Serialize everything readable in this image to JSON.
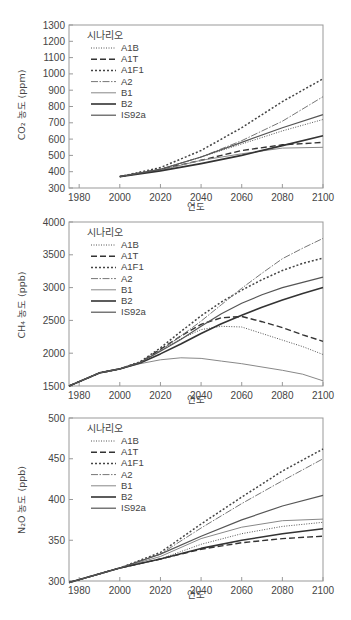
{
  "legend": {
    "title": "시나리오",
    "entries": [
      {
        "name": "A1B",
        "style": "dotted-fine",
        "color": "#555555"
      },
      {
        "name": "A1T",
        "style": "dashed",
        "color": "#333333"
      },
      {
        "name": "A1F1",
        "style": "dotted-coarse",
        "color": "#444444"
      },
      {
        "name": "A2",
        "style": "dash-dot",
        "color": "#777777"
      },
      {
        "name": "B1",
        "style": "solid-light",
        "color": "#888888"
      },
      {
        "name": "B2",
        "style": "solid-thick",
        "color": "#333333"
      },
      {
        "name": "IS92a",
        "style": "solid",
        "color": "#555555"
      }
    ]
  },
  "chart_data": [
    {
      "type": "line",
      "title": "",
      "xlabel": "연도",
      "ylabel": "CO₂ 농도 (ppm)",
      "xlim": [
        1975,
        2100
      ],
      "ylim": [
        300,
        1300
      ],
      "xticks": [
        1980,
        2000,
        2020,
        2040,
        2060,
        2080,
        2100
      ],
      "yticks": [
        300,
        400,
        500,
        600,
        700,
        800,
        900,
        1000,
        1100,
        1200,
        1300
      ],
      "x": [
        2000,
        2020,
        2040,
        2060,
        2080,
        2100
      ],
      "series": [
        {
          "name": "A1B",
          "values": [
            370,
            415,
            490,
            570,
            650,
            720
          ]
        },
        {
          "name": "A1T",
          "values": [
            370,
            415,
            470,
            530,
            565,
            580
          ]
        },
        {
          "name": "A1F1",
          "values": [
            370,
            425,
            530,
            670,
            830,
            970
          ]
        },
        {
          "name": "A2",
          "values": [
            370,
            415,
            490,
            590,
            710,
            860
          ]
        },
        {
          "name": "B1",
          "values": [
            370,
            410,
            470,
            510,
            545,
            550
          ]
        },
        {
          "name": "B2",
          "values": [
            370,
            405,
            450,
            500,
            560,
            620
          ]
        },
        {
          "name": "IS92a",
          "values": [
            370,
            415,
            490,
            580,
            670,
            750
          ]
        }
      ]
    },
    {
      "type": "line",
      "title": "",
      "xlabel": "연도",
      "ylabel": "CH₄ 농도 (ppb)",
      "xlim": [
        1975,
        2100
      ],
      "ylim": [
        1500,
        4000
      ],
      "xticks": [
        1980,
        2000,
        2020,
        2040,
        2060,
        2080,
        2100
      ],
      "yticks": [
        1500,
        2000,
        2500,
        3000,
        3500,
        4000
      ],
      "x": [
        1975,
        1990,
        2000,
        2010,
        2020,
        2030,
        2040,
        2050,
        2060,
        2070,
        2080,
        2090,
        2100
      ],
      "series": [
        {
          "name": "A1B",
          "values": [
            1500,
            1700,
            1760,
            1860,
            2040,
            2220,
            2360,
            2410,
            2400,
            2300,
            2200,
            2100,
            1980
          ]
        },
        {
          "name": "A1T",
          "values": [
            1500,
            1700,
            1760,
            1860,
            2060,
            2260,
            2440,
            2540,
            2560,
            2480,
            2390,
            2280,
            2180
          ]
        },
        {
          "name": "A1F1",
          "values": [
            1500,
            1700,
            1760,
            1870,
            2080,
            2330,
            2570,
            2780,
            2960,
            3120,
            3260,
            3370,
            3450
          ]
        },
        {
          "name": "A2",
          "values": [
            1500,
            1700,
            1760,
            1860,
            2040,
            2260,
            2490,
            2740,
            2990,
            3220,
            3440,
            3600,
            3750
          ]
        },
        {
          "name": "B1",
          "values": [
            1500,
            1700,
            1760,
            1840,
            1900,
            1930,
            1920,
            1880,
            1840,
            1790,
            1740,
            1680,
            1580
          ]
        },
        {
          "name": "B2",
          "values": [
            1500,
            1700,
            1760,
            1850,
            1990,
            2140,
            2300,
            2450,
            2580,
            2700,
            2810,
            2910,
            3000
          ]
        },
        {
          "name": "IS92a",
          "values": [
            1500,
            1700,
            1760,
            1860,
            2030,
            2210,
            2410,
            2600,
            2760,
            2890,
            3000,
            3080,
            3160
          ]
        }
      ]
    },
    {
      "type": "line",
      "title": "",
      "xlabel": "연도",
      "ylabel": "N₂O 농도 (ppb)",
      "xlim": [
        1975,
        2100
      ],
      "ylim": [
        300,
        500
      ],
      "xticks": [
        1980,
        2000,
        2020,
        2040,
        2060,
        2080,
        2100
      ],
      "yticks": [
        300,
        350,
        400,
        450,
        500
      ],
      "x": [
        1975,
        2000,
        2020,
        2040,
        2060,
        2080,
        2100
      ],
      "series": [
        {
          "name": "A1B",
          "values": [
            298,
            316,
            327,
            345,
            358,
            367,
            372
          ]
        },
        {
          "name": "A1T",
          "values": [
            298,
            316,
            327,
            339,
            347,
            352,
            355
          ]
        },
        {
          "name": "A1F1",
          "values": [
            298,
            316,
            335,
            370,
            403,
            435,
            462
          ]
        },
        {
          "name": "A2",
          "values": [
            298,
            316,
            333,
            365,
            395,
            423,
            450
          ]
        },
        {
          "name": "B1",
          "values": [
            298,
            316,
            330,
            352,
            366,
            374,
            376
          ]
        },
        {
          "name": "B2",
          "values": [
            298,
            316,
            327,
            340,
            350,
            358,
            364
          ]
        },
        {
          "name": "IS92a",
          "values": [
            298,
            316,
            333,
            355,
            375,
            392,
            405
          ]
        }
      ]
    }
  ]
}
